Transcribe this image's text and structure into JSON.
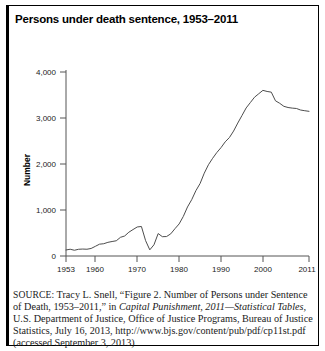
{
  "figure": {
    "title": "Persons under death sentence, 1953–2011",
    "source_keyword": "SOURCE:",
    "source_text_1": " Tracy L. Snell, “Figure 2. Number of Persons under Sentence of Death, 1953–2011,” in ",
    "source_italic": "Capital Punishment, 2011—Statistical Tables,",
    "source_text_2": " U.S. Department of Justice, Office of Justice Programs, Bureau of Justice Statistics, July 16, 2013, http://www.bjs.gov/content/pub/pdf/cp11st.pdf (accessed September 3, 2013)"
  },
  "colors": {
    "line": "#4d4d4d",
    "axis": "#555555",
    "border": "#000000",
    "text": "#1a1a1a",
    "background": "#ffffff"
  },
  "chart_data": {
    "type": "line",
    "title": "Persons under death sentence, 1953–2011",
    "xlabel": "",
    "ylabel": "Number",
    "xlim": [
      1953,
      2011
    ],
    "ylim": [
      0,
      4000
    ],
    "grid": false,
    "legend": null,
    "xticks": [
      1953,
      1960,
      1970,
      1980,
      1990,
      2000,
      2011
    ],
    "xtick_labels": [
      "1953",
      "1960",
      "1970",
      "1980",
      "1990",
      "2000",
      "2011"
    ],
    "yticks": [
      0,
      1000,
      2000,
      3000,
      4000
    ],
    "ytick_labels": [
      "0",
      "1,000",
      "2,000",
      "3,000",
      "4,000"
    ],
    "series": [
      {
        "name": "Persons under sentence of death",
        "x": [
          1953,
          1954,
          1955,
          1956,
          1957,
          1958,
          1959,
          1960,
          1961,
          1962,
          1963,
          1964,
          1965,
          1966,
          1967,
          1968,
          1969,
          1970,
          1971,
          1972,
          1973,
          1974,
          1975,
          1976,
          1977,
          1978,
          1979,
          1980,
          1981,
          1982,
          1983,
          1984,
          1985,
          1986,
          1987,
          1988,
          1989,
          1990,
          1991,
          1992,
          1993,
          1994,
          1995,
          1996,
          1997,
          1998,
          1999,
          2000,
          2001,
          2002,
          2003,
          2004,
          2005,
          2006,
          2007,
          2008,
          2009,
          2010,
          2011
        ],
        "y": [
          131,
          147,
          125,
          146,
          151,
          147,
          164,
          210,
          257,
          267,
          297,
          315,
          331,
          406,
          435,
          517,
          575,
          631,
          642,
          334,
          134,
          244,
          488,
          420,
          423,
          482,
          593,
          697,
          860,
          1066,
          1224,
          1420,
          1575,
          1800,
          1984,
          2124,
          2250,
          2356,
          2482,
          2575,
          2716,
          2890,
          3054,
          3219,
          3335,
          3452,
          3527,
          3601,
          3577,
          3562,
          3374,
          3320,
          3254,
          3228,
          3215,
          3207,
          3173,
          3158,
          3145
        ]
      }
    ],
    "annotations": [
      {
        "text": "peak near 2000 at about 3,600",
        "x": 2000,
        "y": 3601
      },
      {
        "text": "trough in 1973 following Furman v. Georgia",
        "x": 1973,
        "y": 134
      }
    ]
  }
}
